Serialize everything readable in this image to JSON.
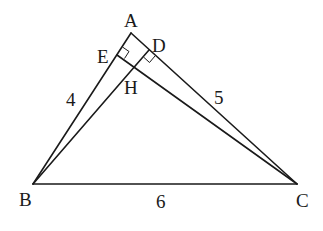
{
  "diagram": {
    "type": "geometry-triangle",
    "points": {
      "A": {
        "label": "A",
        "x": 131,
        "y": 33
      },
      "B": {
        "label": "B",
        "x": 33,
        "y": 184
      },
      "C": {
        "label": "C",
        "x": 297,
        "y": 184
      },
      "D": {
        "label": "D",
        "x": 149,
        "y": 50
      },
      "E": {
        "label": "E",
        "x": 117,
        "y": 55
      },
      "H": {
        "label": "H",
        "x": 132,
        "y": 68
      }
    },
    "segments": [
      {
        "from": "A",
        "to": "B"
      },
      {
        "from": "A",
        "to": "C"
      },
      {
        "from": "B",
        "to": "C"
      },
      {
        "from": "B",
        "to": "D"
      },
      {
        "from": "C",
        "to": "E"
      }
    ],
    "right_angles": [
      "E",
      "D"
    ],
    "side_lengths": {
      "AB": "4",
      "AC": "5",
      "BC": "6"
    }
  }
}
